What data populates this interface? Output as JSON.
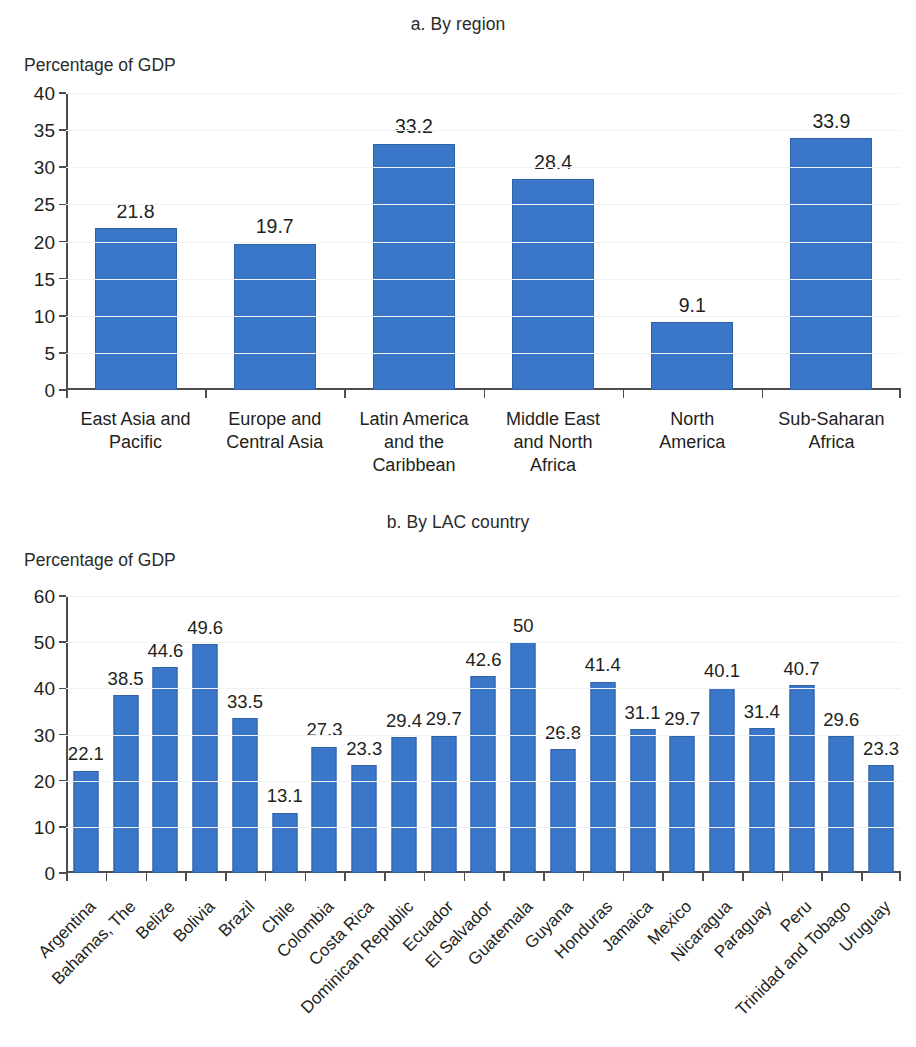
{
  "figure": {
    "panels": [
      {
        "key": "a",
        "title": "a. By region",
        "axis_title": "Percentage of GDP"
      },
      {
        "key": "b",
        "title": "b. By LAC country",
        "axis_title": "Percentage of GDP"
      }
    ],
    "colors": {
      "bar_fill": "#3b77c8",
      "bar_stroke": "#2e61a6",
      "axis": "#4d4d4d",
      "grid": "#f0f1f4",
      "text": "#231f20",
      "background": "#ffffff"
    }
  },
  "chart_data": [
    {
      "type": "bar",
      "title": "a. By region",
      "xlabel": "",
      "ylabel": "Percentage of GDP",
      "ylim": [
        0,
        40
      ],
      "yticks": [
        0,
        5,
        10,
        15,
        20,
        25,
        30,
        35,
        40
      ],
      "ytick_labels": [
        "0",
        "5",
        "10",
        "15",
        "20",
        "25",
        "30",
        "35",
        "40"
      ],
      "grid": true,
      "legend": "none",
      "data_labels": true,
      "categories": [
        "East Asia and Pacific",
        "Europe and Central Asia",
        "Latin America and the Caribbean",
        "Middle East and North Africa",
        "North America",
        "Sub-Saharan Africa"
      ],
      "category_label_lines": [
        [
          "East Asia and",
          "Pacific"
        ],
        [
          "Europe and",
          "Central Asia"
        ],
        [
          "Latin America",
          "and the",
          "Caribbean"
        ],
        [
          "Middle East",
          "and North",
          "Africa"
        ],
        [
          "North",
          "America"
        ],
        [
          "Sub-Saharan",
          "Africa"
        ]
      ],
      "values": [
        21.8,
        19.7,
        33.2,
        28.4,
        9.1,
        33.9
      ],
      "value_labels": [
        "21.8",
        "19.7",
        "33.2",
        "28.4",
        "9.1",
        "33.9"
      ]
    },
    {
      "type": "bar",
      "title": "b. By LAC country",
      "xlabel": "",
      "ylabel": "Percentage of GDP",
      "ylim": [
        0,
        60
      ],
      "yticks": [
        0,
        10,
        20,
        30,
        40,
        50,
        60
      ],
      "ytick_labels": [
        "0",
        "10",
        "20",
        "30",
        "40",
        "50",
        "60"
      ],
      "grid": true,
      "legend": "none",
      "data_labels": true,
      "categories": [
        "Argentina",
        "Bahamas, The",
        "Belize",
        "Bolivia",
        "Brazil",
        "Chile",
        "Colombia",
        "Costa Rica",
        "Dominican Republic",
        "Ecuador",
        "El Salvador",
        "Guatemala",
        "Guyana",
        "Honduras",
        "Jamaica",
        "Mexico",
        "Nicaragua",
        "Paraguay",
        "Peru",
        "Trinidad and Tobago",
        "Uruguay"
      ],
      "values": [
        22.1,
        38.5,
        44.6,
        49.6,
        33.5,
        13.1,
        27.3,
        23.3,
        29.4,
        29.7,
        42.6,
        50,
        26.8,
        41.4,
        31.1,
        29.7,
        40.1,
        31.4,
        40.7,
        29.6,
        23.3
      ],
      "value_labels": [
        "22.1",
        "38.5",
        "44.6",
        "49.6",
        "33.5",
        "13.1",
        "27.3",
        "23.3",
        "29.4",
        "29.7",
        "42.6",
        "50",
        "26.8",
        "41.4",
        "31.1",
        "29.7",
        "40.1",
        "31.4",
        "40.7",
        "29.6",
        "23.3"
      ]
    }
  ]
}
